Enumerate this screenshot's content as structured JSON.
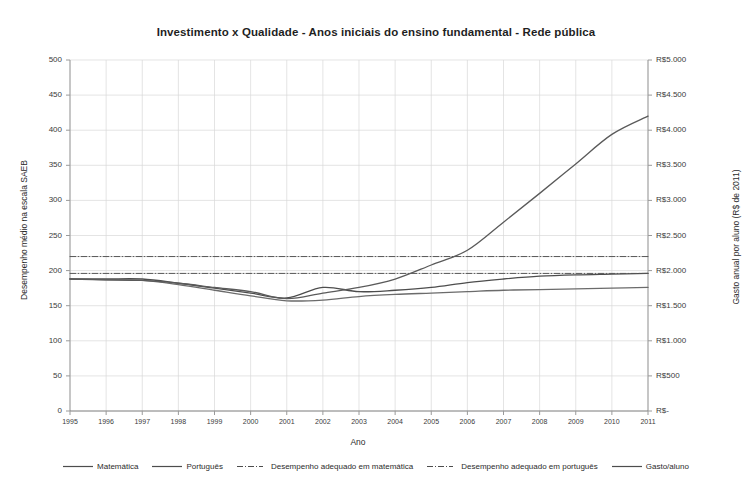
{
  "chart_data": {
    "type": "line",
    "title": "Investimento x Qualidade - Anos iniciais do ensino fundamental - Rede pública",
    "xlabel": "Ano",
    "ylabel": "Desempenho médio na escala SAEB",
    "y2label": "Gasto anual por aluno (R$ de 2011)",
    "grid": true,
    "legend_position": "bottom",
    "xlim": [
      1995,
      2011
    ],
    "ylim": [
      0,
      500
    ],
    "y2lim": [
      0,
      5000
    ],
    "x": [
      1995,
      1996,
      1997,
      1998,
      1999,
      2000,
      2001,
      2002,
      2003,
      2004,
      2005,
      2006,
      2007,
      2008,
      2009,
      2010,
      2011
    ],
    "xticklabels": [
      "1995",
      "1996",
      "1997",
      "1998",
      "1999",
      "2000",
      "2001",
      "2002",
      "2003",
      "2004",
      "2005",
      "2006",
      "2007",
      "2008",
      "2009",
      "2010",
      "2011"
    ],
    "yticks": [
      0,
      50,
      100,
      150,
      200,
      250,
      300,
      350,
      400,
      450,
      500
    ],
    "yticklabels": [
      "0",
      "50",
      "100",
      "150",
      "200",
      "250",
      "300",
      "350",
      "400",
      "450",
      "500"
    ],
    "y2ticks": [
      0,
      500,
      1000,
      1500,
      2000,
      2500,
      3000,
      3500,
      4000,
      4500,
      5000
    ],
    "y2ticklabels": [
      "R$-",
      "R$500",
      "R$1.000",
      "R$1.500",
      "R$2.000",
      "R$2.500",
      "R$3.000",
      "R$3.500",
      "R$4.000",
      "R$4.500",
      "R$5.000"
    ],
    "series": [
      {
        "name": "Matemática",
        "axis": "left",
        "style": "solid",
        "color": "#4d4d4d",
        "values": [
          188,
          188,
          188,
          182,
          175,
          168,
          161,
          176,
          170,
          172,
          176,
          183,
          188,
          192,
          194,
          195,
          196
        ]
      },
      {
        "name": "Português",
        "axis": "left",
        "style": "solid",
        "color": "#6b6b6b",
        "values": [
          188,
          187,
          186,
          180,
          172,
          164,
          157,
          158,
          163,
          166,
          168,
          170,
          172,
          173,
          174,
          175,
          176
        ]
      },
      {
        "name": "Desempenho adequado em matemática",
        "axis": "left",
        "style": "dashdot",
        "color": "#555555",
        "values": [
          220,
          220,
          220,
          220,
          220,
          220,
          220,
          220,
          220,
          220,
          220,
          220,
          220,
          220,
          220,
          220,
          220
        ]
      },
      {
        "name": "Desempenho adequado em português",
        "axis": "left",
        "style": "dashdot",
        "color": "#555555",
        "values": [
          196,
          196,
          196,
          196,
          196,
          196,
          196,
          196,
          196,
          196,
          196,
          196,
          196,
          196,
          196,
          196,
          196
        ]
      },
      {
        "name": "Gasto/aluno",
        "axis": "right",
        "style": "solid",
        "color": "#5a5a5a",
        "values": [
          1880,
          1868,
          1860,
          1820,
          1760,
          1700,
          1600,
          1680,
          1760,
          1880,
          2080,
          2290,
          2690,
          3100,
          3520,
          3940,
          4200
        ],
        "values_on_left_scale": [
          188,
          187,
          186,
          182,
          176,
          170,
          160,
          168,
          176,
          188,
          208,
          229,
          269,
          310,
          352,
          394,
          420
        ]
      }
    ]
  },
  "legend": {
    "items": [
      {
        "label": "Matemática",
        "style": "solid"
      },
      {
        "label": "Português",
        "style": "solid"
      },
      {
        "label": "Desempenho adequado em matemática",
        "style": "dashdot"
      },
      {
        "label": "Desempenho adequado em português",
        "style": "dashdot"
      },
      {
        "label": "Gasto/aluno",
        "style": "solid"
      }
    ]
  }
}
